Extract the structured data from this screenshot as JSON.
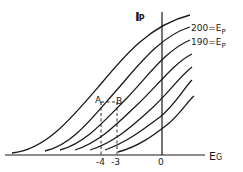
{
  "diagram": {
    "y_axis": {
      "label_main": "I",
      "label_sub": "P"
    },
    "x_axis": {
      "label_main": "E",
      "label_sub": "G"
    },
    "curve_labels": [
      {
        "text": "200=E",
        "sub": "P"
      },
      {
        "text": "190=E",
        "sub": "P"
      }
    ],
    "points": [
      {
        "name": "A",
        "label": "A"
      },
      {
        "name": "B",
        "label": "B"
      }
    ],
    "x_ticks": [
      "-4",
      "-3",
      "0"
    ],
    "curve_count": 7,
    "colors": {
      "ink": "#1a1a1a",
      "background": "#ffffff"
    }
  }
}
